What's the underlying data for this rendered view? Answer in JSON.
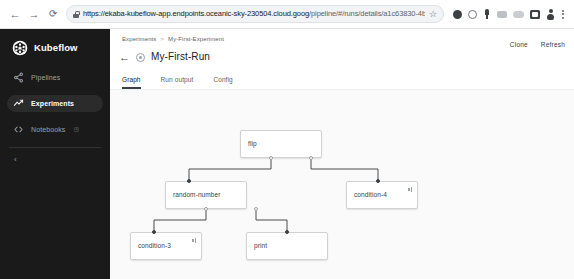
{
  "browser": {
    "back_icon": "back-arrow-icon",
    "forward_icon": "forward-arrow-icon",
    "reload_icon": "reload-icon",
    "lock_icon": "lock-icon",
    "url_host": "https://ekaba-kubeflow-app.endpoints.oceanic-sky-230504.cloud.goog",
    "url_path": "/pipeline/#/runs/details/a1c63830-4bd2-11e9-a0d3-4201...",
    "url_full": "https://ekaba-kubeflow-app.endpoints.oceanic-sky-230504.cloud.goog/pipeline/#/runs/details/a1c63830-4bd2-11e9-a0d3-4201...",
    "star_icon": "☆",
    "back_glyph": "←",
    "forward_glyph": "→",
    "reload_glyph": "⟳",
    "extensions": [
      {
        "name": "extension-icon-1",
        "style": "ext-dot"
      },
      {
        "name": "extension-icon-2",
        "style": "ext-dot ring"
      },
      {
        "name": "extension-icon-pin",
        "style": "ext-dot pin"
      },
      {
        "name": "extension-icon-4",
        "style": "ext-dot grey"
      },
      {
        "name": "extension-icon-5",
        "style": "ext-dot grey2"
      },
      {
        "name": "extension-icon-6",
        "style": "ext-dot square"
      },
      {
        "name": "profile-avatar-icon",
        "style": "ext-dot person"
      }
    ],
    "menu_icon": "kebab-menu-icon"
  },
  "sidebar": {
    "brand": "Kubeflow",
    "logo_icon": "kubeflow-logo-icon",
    "collapse_glyph": "‹",
    "items": [
      {
        "label": "Pipelines",
        "icon": "pipelines-icon",
        "active": false,
        "external": false
      },
      {
        "label": "Experiments",
        "icon": "experiments-icon",
        "active": true,
        "external": false
      },
      {
        "label": "Notebooks",
        "icon": "notebooks-icon",
        "active": false,
        "external": true,
        "external_glyph": "◳"
      }
    ]
  },
  "header": {
    "breadcrumb": {
      "parent": "Experiments",
      "separator": ">",
      "current": "My-First-Experiment"
    },
    "back_glyph": "←",
    "status_icon": "run-status-icon",
    "title": "My-First-Run",
    "actions": [
      {
        "label": "Clone",
        "name": "clone-button"
      },
      {
        "label": "Refresh",
        "name": "refresh-button"
      }
    ],
    "tabs": [
      {
        "label": "Graph",
        "active": true
      },
      {
        "label": "Run output",
        "active": false
      },
      {
        "label": "Config",
        "active": false
      }
    ]
  },
  "graph": {
    "nodes": [
      {
        "id": "flip",
        "label": "flip",
        "x": 240,
        "y": 101,
        "w": 82,
        "h": 28,
        "badge": "check"
      },
      {
        "id": "random-number",
        "label": "random-number",
        "x": 185,
        "y": 152,
        "w": 82,
        "h": 28,
        "badge": "check"
      },
      {
        "id": "condition-4",
        "label": "condition-4",
        "x": 288,
        "y": 152,
        "w": 72,
        "h": 28,
        "badge": "condition"
      },
      {
        "id": "condition-3",
        "label": "condition-3",
        "x": 143,
        "y": 203,
        "w": 72,
        "h": 28,
        "badge": "condition"
      },
      {
        "id": "print",
        "label": "print",
        "x": 236,
        "y": 203,
        "w": 82,
        "h": 28,
        "badge": "check"
      }
    ],
    "edges": [
      {
        "from": "flip",
        "to": "random-number"
      },
      {
        "from": "flip",
        "to": "condition-4"
      },
      {
        "from": "random-number",
        "to": "condition-3"
      },
      {
        "from": "random-number",
        "to": "print"
      }
    ]
  }
}
